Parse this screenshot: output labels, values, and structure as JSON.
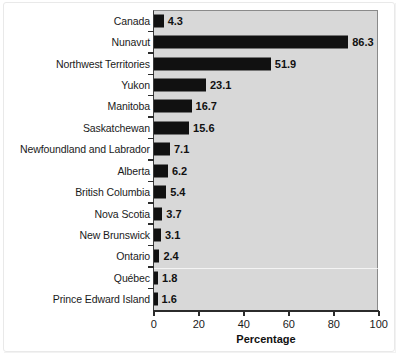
{
  "chart_data": {
    "type": "bar",
    "orientation": "horizontal",
    "title": "",
    "xlabel": "Percentage",
    "ylabel": "",
    "xlim": [
      0,
      100
    ],
    "xticks": [
      0,
      20,
      40,
      60,
      80,
      100
    ],
    "grid": false,
    "legend": null,
    "categories": [
      "Canada",
      "Nunavut",
      "Northwest Territories",
      "Yukon",
      "Manitoba",
      "Saskatchewan",
      "Newfoundland and Labrador",
      "Alberta",
      "British Columbia",
      "Nova Scotia",
      "New Brunswick",
      "Ontario",
      "Québec",
      "Prince Edward Island"
    ],
    "values": [
      4.3,
      86.3,
      51.9,
      23.1,
      16.7,
      15.6,
      7.1,
      6.2,
      5.4,
      3.7,
      3.1,
      2.4,
      1.8,
      1.6
    ],
    "value_labels": [
      "4.3",
      "86.3",
      "51.9",
      "23.1",
      "16.7",
      "15.6",
      "7.1",
      "6.2",
      "5.4",
      "3.7",
      "3.1",
      "2.4",
      "1.8",
      "1.6"
    ],
    "tick_labels": [
      "0",
      "20",
      "40",
      "60",
      "80",
      "100"
    ],
    "colors": {
      "bar": "#111111",
      "plot_background": "#d8d8d8",
      "figure_background": "#ffffff",
      "axis": "#2b2b2b",
      "text": "#1a1a1a"
    }
  }
}
